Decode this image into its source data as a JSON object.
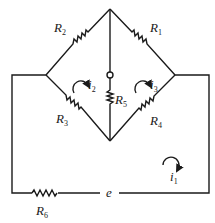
{
  "diagram": {
    "type": "bridge-circuit",
    "resistors": [
      {
        "id": "R1",
        "label": "R",
        "sub": "1"
      },
      {
        "id": "R2",
        "label": "R",
        "sub": "2"
      },
      {
        "id": "R3",
        "label": "R",
        "sub": "3"
      },
      {
        "id": "R4",
        "label": "R",
        "sub": "4"
      },
      {
        "id": "R5",
        "label": "R",
        "sub": "5"
      },
      {
        "id": "R6",
        "label": "R",
        "sub": "6"
      }
    ],
    "currents": [
      {
        "id": "i1",
        "label": "i",
        "sub": "1"
      },
      {
        "id": "i2",
        "label": "i",
        "sub": "2"
      },
      {
        "id": "i3",
        "label": "i",
        "sub": "3"
      }
    ],
    "source": {
      "label": "e"
    }
  }
}
